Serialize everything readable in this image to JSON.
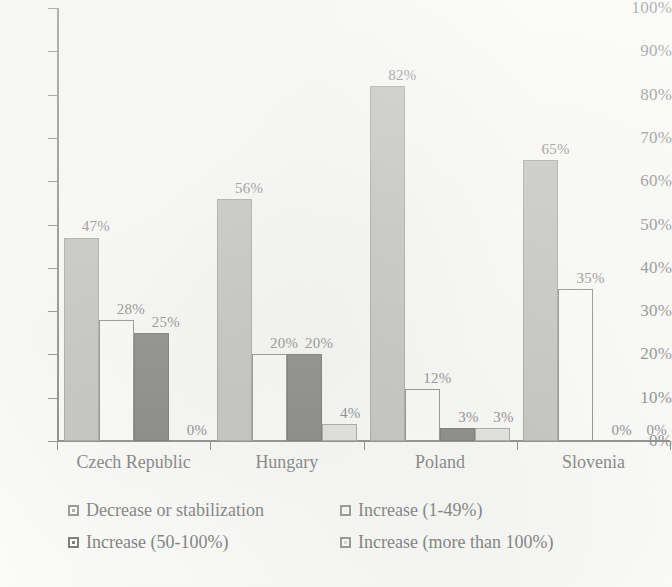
{
  "chart_data": {
    "type": "bar",
    "title": "",
    "xlabel": "",
    "ylabel": "",
    "ylim": [
      0,
      100
    ],
    "grid": false,
    "legend_position": "bottom",
    "categories": [
      "Czech Republic",
      "Hungary",
      "Poland",
      "Slovenia"
    ],
    "ytick_labels": [
      "0%",
      "10%",
      "20%",
      "30%",
      "40%",
      "50%",
      "60%",
      "70%",
      "80%",
      "90%",
      "100%"
    ],
    "ytick_values": [
      0,
      10,
      20,
      30,
      40,
      50,
      60,
      70,
      80,
      90,
      100
    ],
    "series": [
      {
        "name": "Decrease or stabilization",
        "color": "#b4b4b4",
        "values": [
          47,
          56,
          82,
          65
        ],
        "labels": [
          "47%",
          "56%",
          "82%",
          "65%"
        ]
      },
      {
        "name": "Increase (1-49%)",
        "color": "#ffffff",
        "values": [
          28,
          20,
          12,
          35
        ],
        "labels": [
          "28%",
          "20%",
          "12%",
          "35%"
        ]
      },
      {
        "name": "Increase (50-100%)",
        "color": "#636363",
        "values": [
          25,
          20,
          3,
          0
        ],
        "labels": [
          "25%",
          "20%",
          "3%",
          "0%"
        ]
      },
      {
        "name": "Increase (more than 100%)",
        "color": "#dcdcdc",
        "values": [
          0,
          4,
          3,
          0
        ],
        "labels": [
          "0%",
          "4%",
          "3%",
          "0%"
        ]
      }
    ]
  }
}
